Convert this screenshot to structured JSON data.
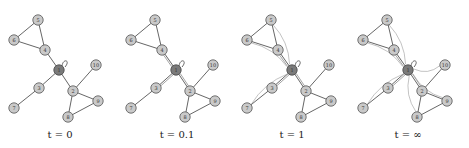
{
  "figure": {
    "panels": [
      {
        "id": "p0",
        "offset_x": 0,
        "caption": "t = 0",
        "caption_x": 60
      },
      {
        "id": "p1",
        "offset_x": 117,
        "caption": "t = 0.1",
        "caption_x": 177
      },
      {
        "id": "p2",
        "offset_x": 233,
        "caption": "t = 1",
        "caption_x": 292
      },
      {
        "id": "p3",
        "offset_x": 349,
        "caption": "t = ∞",
        "caption_x": 408
      }
    ],
    "nodes": [
      {
        "id": "1",
        "x": 59,
        "y": 70,
        "hub": true
      },
      {
        "id": "2",
        "x": 73,
        "y": 91
      },
      {
        "id": "3",
        "x": 39,
        "y": 88
      },
      {
        "id": "4",
        "x": 45,
        "y": 50
      },
      {
        "id": "5",
        "x": 38,
        "y": 20
      },
      {
        "id": "6",
        "x": 14,
        "y": 40
      },
      {
        "id": "7",
        "x": 14,
        "y": 108
      },
      {
        "id": "8",
        "x": 68,
        "y": 117
      },
      {
        "id": "9",
        "x": 98,
        "y": 101
      },
      {
        "id": "10",
        "x": 96,
        "y": 65
      }
    ],
    "edges": [
      [
        "5",
        "6"
      ],
      [
        "5",
        "4"
      ],
      [
        "6",
        "4"
      ],
      [
        "4",
        "1"
      ],
      [
        "1",
        "3"
      ],
      [
        "3",
        "7"
      ],
      [
        "1",
        "2"
      ],
      [
        "2",
        "10"
      ],
      [
        "2",
        "9"
      ],
      [
        "2",
        "8"
      ],
      [
        "8",
        "9"
      ]
    ],
    "hub_node": "1",
    "colors": {
      "node_fill": "#c9c9c9",
      "hub_fill": "#7a7a7a",
      "edge": "#555555",
      "flow": "#9a9a9a"
    }
  }
}
